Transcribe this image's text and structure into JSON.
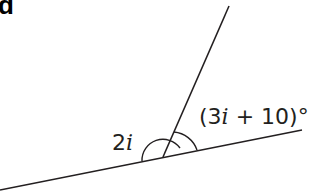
{
  "figure": {
    "part_label": "d",
    "angle_left": {
      "coef": "2",
      "var": "i"
    },
    "angle_right": {
      "open": "(3",
      "var": "i",
      "rest": " + 10)°"
    },
    "colors": {
      "stroke": "#231f20",
      "background": "#ffffff"
    }
  }
}
